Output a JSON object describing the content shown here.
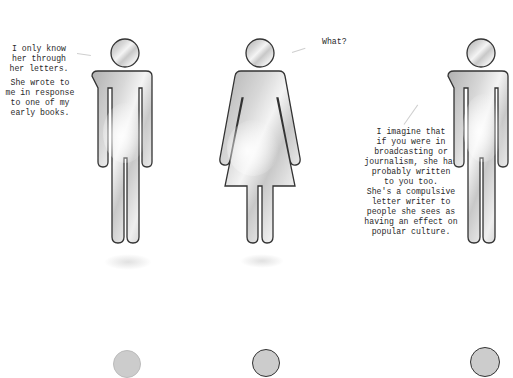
{
  "captions": {
    "left": "I only know\nher through\nher letters.",
    "left_2": "She wrote to\nme in response\nto one of my\nearly books.",
    "center": "What?",
    "right": "I imagine that\nif you were in\nbroadcasting or\njournalism, she has\nprobably written\nto you too.\nShe's a compulsive\nletter writer to\npeople she sees as\nhaving an effect on\npopular culture."
  },
  "figures": [
    {
      "type": "man",
      "label": "left-man-figure"
    },
    {
      "type": "woman",
      "label": "center-woman-figure"
    },
    {
      "type": "man",
      "label": "right-man-figure"
    }
  ],
  "colors": {
    "outline": "#333333",
    "sky_light": "#f2f2f2",
    "sky_dark": "#9a9a9a",
    "background": "#ffffff"
  }
}
